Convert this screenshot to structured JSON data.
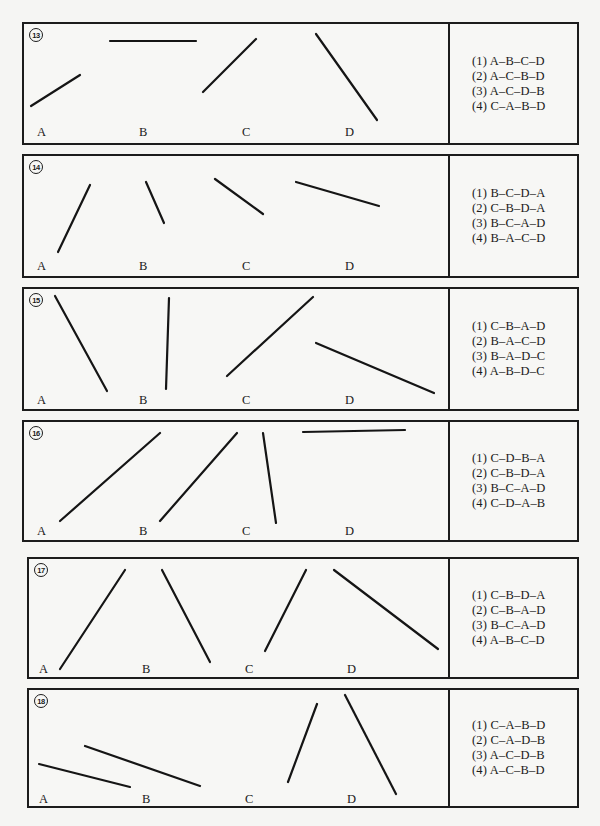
{
  "questions": [
    {
      "number": "13",
      "box": {
        "x": 22,
        "y": 22,
        "w": 557,
        "h": 123,
        "divider": 426
      },
      "labels": [
        {
          "text": "A",
          "x": 13,
          "y": 101
        },
        {
          "text": "B",
          "x": 115,
          "y": 101
        },
        {
          "text": "C",
          "x": 218,
          "y": 101
        },
        {
          "text": "D",
          "x": 321,
          "y": 101
        }
      ],
      "segments": [
        {
          "name": "A",
          "x1": 31,
          "y1": 106,
          "x2": 80,
          "y2": 75
        },
        {
          "name": "B",
          "x1": 110,
          "y1": 41,
          "x2": 196,
          "y2": 41
        },
        {
          "name": "C",
          "x1": 203,
          "y1": 92,
          "x2": 256,
          "y2": 39
        },
        {
          "name": "D",
          "x1": 316,
          "y1": 34,
          "x2": 377,
          "y2": 120
        }
      ],
      "options": [
        "(1) A–B–C–D",
        "(2) A–C–B–D",
        "(3) A–C–D–B",
        "(4) C–A–B–D"
      ]
    },
    {
      "number": "14",
      "box": {
        "x": 22,
        "y": 154,
        "w": 557,
        "h": 124,
        "divider": 426
      },
      "labels": [
        {
          "text": "A",
          "x": 13,
          "y": 103
        },
        {
          "text": "B",
          "x": 115,
          "y": 103
        },
        {
          "text": "C",
          "x": 218,
          "y": 103
        },
        {
          "text": "D",
          "x": 321,
          "y": 103
        }
      ],
      "segments": [
        {
          "name": "A",
          "x1": 58,
          "y1": 252,
          "x2": 90,
          "y2": 185
        },
        {
          "name": "B",
          "x1": 146,
          "y1": 182,
          "x2": 164,
          "y2": 223
        },
        {
          "name": "C",
          "x1": 215,
          "y1": 179,
          "x2": 263,
          "y2": 214
        },
        {
          "name": "D",
          "x1": 296,
          "y1": 182,
          "x2": 379,
          "y2": 206
        }
      ],
      "options": [
        "(1) B–C–D–A",
        "(2) C–B–D–A",
        "(3) B–C–A–D",
        "(4) B–A–C–D"
      ]
    },
    {
      "number": "15",
      "box": {
        "x": 22,
        "y": 287,
        "w": 557,
        "h": 124,
        "divider": 426
      },
      "labels": [
        {
          "text": "A",
          "x": 13,
          "y": 104
        },
        {
          "text": "B",
          "x": 115,
          "y": 104
        },
        {
          "text": "C",
          "x": 218,
          "y": 104
        },
        {
          "text": "D",
          "x": 321,
          "y": 104
        }
      ],
      "segments": [
        {
          "name": "A",
          "x1": 55,
          "y1": 296,
          "x2": 107,
          "y2": 391
        },
        {
          "name": "B",
          "x1": 169,
          "y1": 298,
          "x2": 166,
          "y2": 389
        },
        {
          "name": "C",
          "x1": 227,
          "y1": 376,
          "x2": 313,
          "y2": 297
        },
        {
          "name": "D",
          "x1": 316,
          "y1": 343,
          "x2": 434,
          "y2": 393
        }
      ],
      "options": [
        "(1) C–B–A–D",
        "(2) B–A–C–D",
        "(3) B–A–D–C",
        "(4) A–B–D–C"
      ]
    },
    {
      "number": "16",
      "box": {
        "x": 22,
        "y": 420,
        "w": 557,
        "h": 122,
        "divider": 426
      },
      "labels": [
        {
          "text": "A",
          "x": 13,
          "y": 102
        },
        {
          "text": "B",
          "x": 115,
          "y": 102
        },
        {
          "text": "C",
          "x": 218,
          "y": 102
        },
        {
          "text": "D",
          "x": 321,
          "y": 102
        }
      ],
      "segments": [
        {
          "name": "A",
          "x1": 60,
          "y1": 521,
          "x2": 160,
          "y2": 433
        },
        {
          "name": "B",
          "x1": 160,
          "y1": 521,
          "x2": 237,
          "y2": 433
        },
        {
          "name": "C",
          "x1": 263,
          "y1": 433,
          "x2": 276,
          "y2": 523
        },
        {
          "name": "D",
          "x1": 303,
          "y1": 432,
          "x2": 405,
          "y2": 430
        }
      ],
      "options": [
        "(1) C–D–B–A",
        "(2) C–B–D–A",
        "(3) B–C–A–D",
        "(4) C–D–A–B"
      ]
    },
    {
      "number": "17",
      "box": {
        "x": 27,
        "y": 557,
        "w": 552,
        "h": 122,
        "divider": 421
      },
      "labels": [
        {
          "text": "A",
          "x": 10,
          "y": 103
        },
        {
          "text": "B",
          "x": 113,
          "y": 103
        },
        {
          "text": "C",
          "x": 216,
          "y": 103
        },
        {
          "text": "D",
          "x": 318,
          "y": 103
        }
      ],
      "segments": [
        {
          "name": "A",
          "x1": 60,
          "y1": 669,
          "x2": 125,
          "y2": 570
        },
        {
          "name": "B",
          "x1": 162,
          "y1": 570,
          "x2": 210,
          "y2": 662
        },
        {
          "name": "C",
          "x1": 265,
          "y1": 651,
          "x2": 306,
          "y2": 570
        },
        {
          "name": "D",
          "x1": 334,
          "y1": 570,
          "x2": 438,
          "y2": 649
        }
      ],
      "options": [
        "(1) C–B–D–A",
        "(2) C–B–A–D",
        "(3) B–C–A–D",
        "(4) A–B–C–D"
      ]
    },
    {
      "number": "18",
      "box": {
        "x": 27,
        "y": 688,
        "w": 552,
        "h": 120,
        "divider": 421
      },
      "labels": [
        {
          "text": "A",
          "x": 10,
          "y": 102
        },
        {
          "text": "B",
          "x": 113,
          "y": 102
        },
        {
          "text": "C",
          "x": 216,
          "y": 102
        },
        {
          "text": "D",
          "x": 318,
          "y": 102
        }
      ],
      "segments": [
        {
          "name": "A",
          "x1": 39,
          "y1": 764,
          "x2": 130,
          "y2": 787
        },
        {
          "name": "B",
          "x1": 85,
          "y1": 746,
          "x2": 200,
          "y2": 786
        },
        {
          "name": "C",
          "x1": 288,
          "y1": 782,
          "x2": 317,
          "y2": 704
        },
        {
          "name": "D",
          "x1": 345,
          "y1": 695,
          "x2": 396,
          "y2": 794
        }
      ],
      "options": [
        "(1) C–A–B–D",
        "(2) C–A–D–B",
        "(3) A–C–D–B",
        "(4) A–C–B–D"
      ]
    }
  ]
}
